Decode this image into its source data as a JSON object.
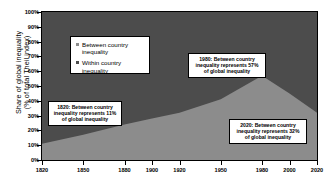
{
  "chart_data": {
    "type": "area",
    "stacked": true,
    "title": "",
    "xlabel": "",
    "ylabel": "Share of global inequality\n(% of total Theil index)",
    "xlim": [
      1820,
      2020
    ],
    "ylim": [
      0,
      100
    ],
    "grid": false,
    "legend_position": "upper-left-inside",
    "x": [
      1820,
      1850,
      1880,
      1900,
      1920,
      1950,
      1980,
      2000,
      2020
    ],
    "xticklabels": [
      "1820",
      "1850",
      "1880",
      "1900",
      "1920",
      "1950",
      "1980",
      "2000",
      "2020"
    ],
    "yticklabels": [
      "0%",
      "10%",
      "20%",
      "30%",
      "40%",
      "50%",
      "60%",
      "70%",
      "80%",
      "90%",
      "100%"
    ],
    "yticks": [
      0,
      10,
      20,
      30,
      40,
      50,
      60,
      70,
      80,
      90,
      100
    ],
    "series": [
      {
        "name": "Between country inequality",
        "color": "#8c8c8c",
        "values": [
          11,
          17,
          24,
          28,
          32,
          41,
          57,
          45,
          32
        ]
      },
      {
        "name": "Within country inequality",
        "color": "#4c4c4c",
        "values": [
          89,
          83,
          76,
          72,
          68,
          59,
          43,
          55,
          68
        ]
      }
    ],
    "annotations": [
      {
        "id": "1820",
        "lines": [
          "1820: Between country",
          "inequality  represents 11%",
          "of global inequality"
        ]
      },
      {
        "id": "1980",
        "lines": [
          "1980: Between country",
          "inequality  represents 57%",
          "of global inequality"
        ]
      },
      {
        "id": "2020",
        "lines": [
          "2020: Between country",
          "inequality  represents 32%",
          "of global inequality"
        ]
      }
    ]
  },
  "legend": {
    "items": [
      {
        "label": "Between country inequality",
        "color": "#8c8c8c"
      },
      {
        "label": "Within country inequality",
        "color": "#4c4c4c"
      }
    ]
  }
}
